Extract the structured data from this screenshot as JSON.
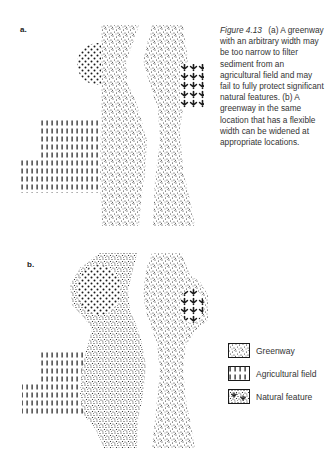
{
  "figure": {
    "panel_a_label": "a.",
    "panel_b_label": "b.",
    "caption": {
      "figure_number": "Figure 4.13",
      "text": "(a) A greenway with an arbitrary width may be too narrow to filter sediment from an agricultural field and may fail to fully protect significant natural features. (b) A greenway in the same location that has a flexible width can be widened at appropriate locations."
    },
    "legend": {
      "items": [
        {
          "label": "Greenway",
          "pattern": "fine-stipple"
        },
        {
          "label": "Agricultural field",
          "pattern": "vertical-dashes"
        },
        {
          "label": "Natural feature",
          "pattern": "tree-symbols"
        }
      ]
    },
    "colors": {
      "ink": "#1a1a1a",
      "background": "#ffffff",
      "text": "#333333"
    }
  }
}
